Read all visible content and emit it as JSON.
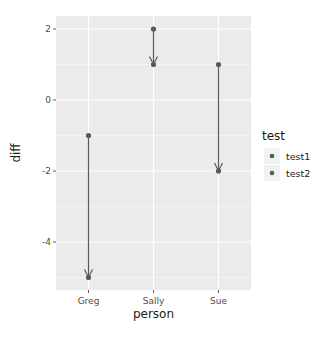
{
  "chart_data": {
    "type": "arrow-segment",
    "title": "",
    "xlabel": "person",
    "ylabel": "diff",
    "categories": [
      "Greg",
      "Sally",
      "Sue"
    ],
    "series": [
      {
        "name": "test1",
        "values": [
          -1,
          2,
          1
        ]
      },
      {
        "name": "test2",
        "values": [
          -5,
          1,
          -2
        ]
      }
    ],
    "arrows": [
      {
        "person": "Greg",
        "from": -1,
        "to": -5
      },
      {
        "person": "Sally",
        "from": 2,
        "to": 1
      },
      {
        "person": "Sue",
        "from": 1,
        "to": -2
      }
    ],
    "yticks": [
      2,
      0,
      -2,
      -4
    ],
    "ytick_labels": [
      "2",
      "0",
      "-2",
      "-4"
    ],
    "ylim": [
      -5.3,
      2.4
    ],
    "grid": true,
    "legend": {
      "title": "test",
      "position": "right",
      "entries": [
        "test1",
        "test2"
      ]
    },
    "colors": {
      "panel": "#ebebeb",
      "grid": "#ffffff",
      "points": "#595959",
      "arrows": "#595959"
    }
  }
}
